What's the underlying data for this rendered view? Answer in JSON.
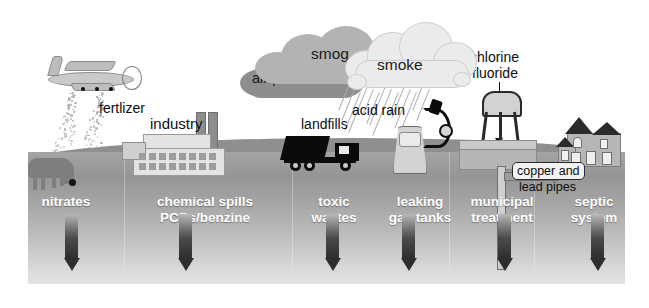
{
  "diagram": {
    "air_labels": [
      {
        "id": "smog",
        "text": "smog"
      },
      {
        "id": "air-pollution",
        "text": "air pollution"
      },
      {
        "id": "smoke",
        "text": "smoke"
      },
      {
        "id": "acid-rain",
        "text": "acid rain"
      }
    ],
    "surface_labels": [
      {
        "id": "fertlizer",
        "text": "fertlizer"
      },
      {
        "id": "industry",
        "text": "industry"
      },
      {
        "id": "landfills",
        "text": "landfills"
      },
      {
        "id": "chlorine",
        "text": "chlorine"
      },
      {
        "id": "fluoride",
        "text": "fluoride"
      },
      {
        "id": "copper-and",
        "text": "copper and"
      },
      {
        "id": "lead-pipes",
        "text": "lead pipes"
      }
    ],
    "ground_labels": [
      {
        "id": "nitrates",
        "line1": "nitrates",
        "line2": ""
      },
      {
        "id": "chemical-spills",
        "line1": "chemical spills",
        "line2": "PCBs/benzine"
      },
      {
        "id": "toxic-wastes",
        "line1": "toxic",
        "line2": "wastes"
      },
      {
        "id": "leaking-gas-tanks",
        "line1": "leaking",
        "line2": "gas tanks"
      },
      {
        "id": "municipal-treatment",
        "line1": "municipal",
        "line2": "treatment"
      },
      {
        "id": "septic-system",
        "line1": "septic",
        "line2": "system"
      }
    ],
    "arrow_count": 6,
    "colors": {
      "cloud_dark": "#8e8e8e",
      "cloud_mid": "#b3b3b3",
      "cloud_light": "#ebebeb",
      "ground_top": "#8f8f8f",
      "ground_bottom": "#e2e2e2",
      "arrow": "#2e2e2e",
      "label_white": "#ffffff",
      "label_black": "#0d0d0d"
    }
  }
}
